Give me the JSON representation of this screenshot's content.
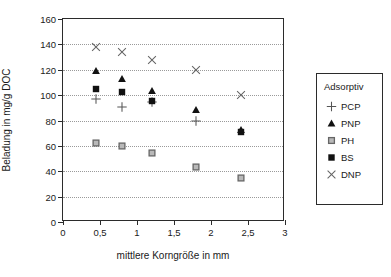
{
  "chart_data": {
    "type": "scatter",
    "title": "",
    "xlabel": "mittlere Korngröße in mm",
    "ylabel": "Beladung in mg/g DOC",
    "xlim": [
      0,
      3
    ],
    "ylim": [
      0,
      160
    ],
    "xticks": [
      "0",
      "0,5",
      "1",
      "1,5",
      "2",
      "2,5",
      "3"
    ],
    "xtick_values": [
      0,
      0.5,
      1,
      1.5,
      2,
      2.5,
      3
    ],
    "yticks": [
      "0",
      "20",
      "40",
      "60",
      "80",
      "100",
      "120",
      "140",
      "160"
    ],
    "ytick_values": [
      0,
      20,
      40,
      60,
      80,
      100,
      120,
      140,
      160
    ],
    "grid": "horizontal-dotted",
    "legend_position": "right-outside",
    "legend_title": "Adsorptiv",
    "x": [
      0.45,
      0.8,
      1.2,
      1.8,
      2.4
    ],
    "series": [
      {
        "name": "PCP",
        "marker": "plus",
        "color": "#555555",
        "values": [
          97,
          90.5,
          94.5,
          80,
          null
        ]
      },
      {
        "name": "PNP",
        "marker": "triangle",
        "color": "#111111",
        "values": [
          119,
          113,
          103,
          88,
          72.5
        ]
      },
      {
        "name": "PH",
        "marker": "dotted-square",
        "color": "#666666",
        "values": [
          62.5,
          60,
          54,
          43.5,
          35
        ]
      },
      {
        "name": "BS",
        "marker": "square",
        "color": "#111111",
        "values": [
          105,
          102.5,
          95.5,
          null,
          71
        ]
      },
      {
        "name": "DNP",
        "marker": "cross",
        "color": "#666666",
        "values": [
          138,
          134,
          127.5,
          120,
          100
        ]
      }
    ]
  },
  "legend": {
    "title": "Adsorptiv",
    "items": [
      {
        "label": "PCP",
        "marker": "plus"
      },
      {
        "label": "PNP",
        "marker": "triangle"
      },
      {
        "label": "PH",
        "marker": "dotted-square"
      },
      {
        "label": "BS",
        "marker": "square"
      },
      {
        "label": "DNP",
        "marker": "cross"
      }
    ]
  }
}
